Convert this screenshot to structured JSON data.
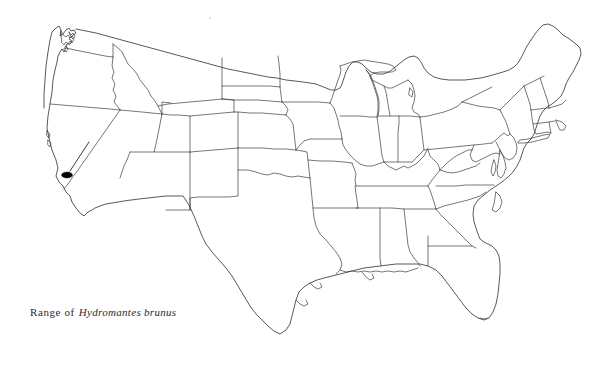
{
  "figure": {
    "type": "range-map",
    "region": "Contiguous United States",
    "background_color": "#ffffff",
    "line_color": "#3c3c3c",
    "marker_color": "#000000"
  },
  "caption": {
    "prefix": "Range of",
    "species": "Hydromantes brunus",
    "full_text": "Range of Hydromantes brunus"
  },
  "map": {
    "title": "",
    "projection_note": "",
    "outline_style": "state-boundaries",
    "features": {
      "national_border_label": "United States outline",
      "state_borders_label": "State boundaries",
      "great_lakes_label": "Great Lakes shoreline",
      "coastline_label": "Coastline"
    }
  },
  "range": {
    "marker_label": "Range of Hydromantes brunus",
    "locality": "Sierra Nevada foothills, central California",
    "marker_shape": "filled-ellipse",
    "marker_center": {
      "x": 67,
      "y": 175
    },
    "marker_size": {
      "width": 11,
      "height": 6
    },
    "leader_line": {
      "x1": 89,
      "y1": 142,
      "x2": 70,
      "y2": 171
    }
  },
  "artifacts": {
    "speck_label": "scan speck",
    "speck_position": {
      "x": 210,
      "y": 18
    }
  }
}
